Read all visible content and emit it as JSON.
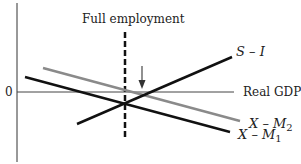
{
  "diagram": {
    "title": "",
    "y_axis_zero_label": "0",
    "x_axis_label": "Real GDP",
    "full_employment_label": "Full employment",
    "curves": [
      {
        "id": "s-minus-i",
        "label_main": "S",
        "label_op": " – ",
        "label_var": "I",
        "color": "#111111"
      },
      {
        "id": "x-minus-m2",
        "label_main": "X",
        "label_op": " – ",
        "label_var": "M",
        "label_sub": "2",
        "color": "#8a8a8a"
      },
      {
        "id": "x-minus-m1",
        "label_main": "X",
        "label_op": " – ",
        "label_var": "M",
        "label_sub": "1",
        "color": "#111111"
      }
    ],
    "arrow": {
      "direction": "down",
      "color": "#555555"
    }
  }
}
